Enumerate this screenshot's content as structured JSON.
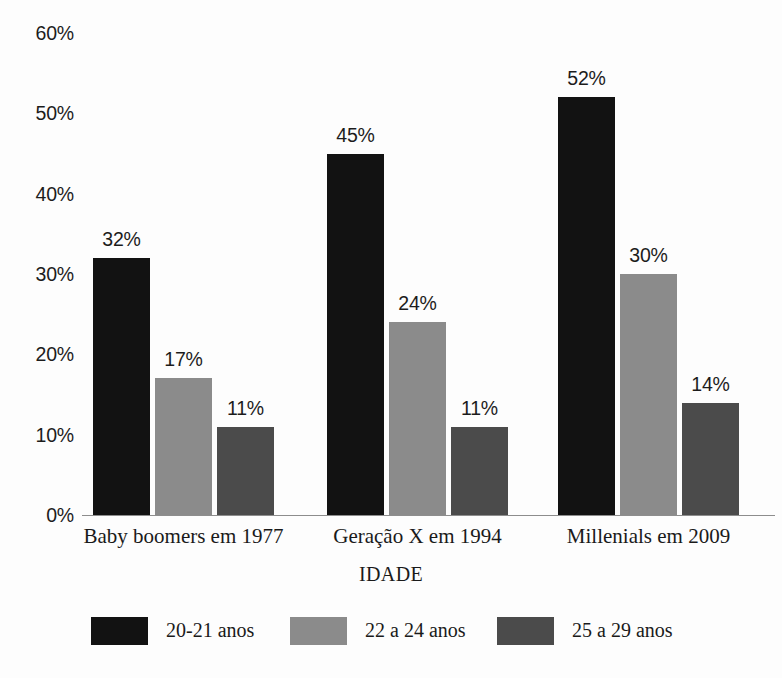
{
  "chart_data": {
    "type": "bar",
    "title": "",
    "subtitle": "",
    "xlabel": "IDADE",
    "ylabel": "",
    "categories": [
      "Baby boomers em 1977",
      "Geração X em 1994",
      "Millenials em 2009"
    ],
    "series": [
      {
        "name": "20-21 anos",
        "color": "#121212",
        "values": [
          32,
          45,
          52
        ],
        "labels": [
          "32%",
          "45%",
          "52%"
        ]
      },
      {
        "name": "22 a 24 anos",
        "color": "#8b8b8b",
        "values": [
          17,
          24,
          30
        ],
        "labels": [
          "17%",
          "24%",
          "30%"
        ]
      },
      {
        "name": "25 a 29 anos",
        "color": "#4b4b4b",
        "values": [
          11,
          11,
          14
        ],
        "labels": [
          "11%",
          "11%",
          "14%"
        ]
      }
    ],
    "ylim": [
      0,
      60
    ],
    "ytick_step": 10,
    "ytick_labels": [
      "60%",
      "50%",
      "40%",
      "30%",
      "20%",
      "10%",
      "0%"
    ],
    "ytick_values": [
      60,
      50,
      40,
      30,
      20,
      10,
      0
    ],
    "grid": false,
    "legend_position": "bottom",
    "value_labels_shown": true,
    "axis_color": "#8d8d8d",
    "background_color": "#fdfdfd",
    "text_color": "#1a1a1a"
  }
}
